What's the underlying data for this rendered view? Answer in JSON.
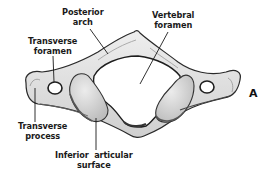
{
  "figure": {
    "panel_letter": "A",
    "labels": {
      "posterior_arch": [
        "Posterior",
        "arch"
      ],
      "vertebral_foramen": [
        "Vertebral",
        "foramen"
      ],
      "transverse_foramen": [
        "Transverse",
        "foramen"
      ],
      "transverse_process": [
        "Transverse",
        "process"
      ],
      "inferior_articular_surface": [
        "Inferior  articular",
        "surface"
      ]
    },
    "colors": {
      "bone_fill": "#e4e4e4",
      "bone_shade": "#b8b8b8",
      "outline": "#2a2a2a",
      "text": "#1a1a1a",
      "background": "#ffffff"
    }
  }
}
